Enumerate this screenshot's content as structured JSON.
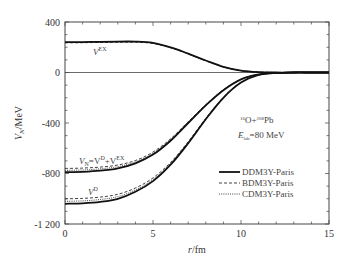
{
  "chart_data": {
    "type": "line",
    "title": "",
    "xlabel": "r/fm",
    "ylabel": "V_N/MeV",
    "xlim": [
      0,
      15
    ],
    "ylim": [
      -1200,
      400
    ],
    "x_ticks": [
      "0",
      "5",
      "10",
      "15"
    ],
    "y_ticks": [
      "400",
      "0",
      "-400",
      "-800",
      "-1 200"
    ],
    "grid": false,
    "legend_position": "lower right",
    "annotation": {
      "reaction": "16O+208Pb",
      "energy": "E_lab=80 MeV"
    },
    "curve_labels": [
      "V^EX",
      "V_N=V^D+V^EX",
      "V^D"
    ],
    "legend": [
      "DDM3Y-Paris",
      "BDM3Y-Paris",
      "CDM3Y-Paris"
    ],
    "x": [
      0,
      1,
      2,
      3,
      4,
      5,
      6,
      7,
      8,
      9,
      10,
      11,
      12,
      13,
      14,
      15
    ],
    "series": [
      {
        "name": "V^EX DDM3Y-Paris",
        "style": "solid",
        "values": [
          240,
          241,
          243,
          245,
          245,
          235,
          200,
          150,
          95,
          45,
          15,
          3,
          0,
          0,
          0,
          0
        ]
      },
      {
        "name": "V^EX BDM3Y-Paris",
        "style": "dashed",
        "values": [
          235,
          236,
          238,
          240,
          240,
          230,
          196,
          147,
          93,
          44,
          15,
          3,
          0,
          0,
          0,
          0
        ]
      },
      {
        "name": "V^EX CDM3Y-Paris",
        "style": "dotted",
        "values": [
          238,
          239,
          241,
          243,
          243,
          233,
          198,
          149,
          94,
          45,
          15,
          3,
          0,
          0,
          0,
          0
        ]
      },
      {
        "name": "V_N DDM3Y-Paris",
        "style": "solid",
        "values": [
          -790,
          -787,
          -778,
          -760,
          -720,
          -650,
          -540,
          -400,
          -260,
          -140,
          -55,
          -15,
          -3,
          0,
          0,
          0
        ]
      },
      {
        "name": "V_N BDM3Y-Paris",
        "style": "dashed",
        "values": [
          -760,
          -757,
          -749,
          -733,
          -697,
          -630,
          -525,
          -390,
          -255,
          -137,
          -54,
          -15,
          -3,
          0,
          0,
          0
        ]
      },
      {
        "name": "V_N CDM3Y-Paris",
        "style": "dotted",
        "values": [
          -775,
          -772,
          -763,
          -746,
          -708,
          -640,
          -532,
          -395,
          -257,
          -138,
          -54,
          -15,
          -3,
          0,
          0,
          0
        ]
      },
      {
        "name": "V^D DDM3Y-Paris",
        "style": "solid",
        "values": [
          -1040,
          -1036,
          -1025,
          -1000,
          -945,
          -860,
          -730,
          -560,
          -370,
          -200,
          -80,
          -20,
          -4,
          0,
          0,
          0
        ]
      },
      {
        "name": "V^D BDM3Y-Paris",
        "style": "dashed",
        "values": [
          -1000,
          -997,
          -987,
          -965,
          -915,
          -835,
          -712,
          -548,
          -363,
          -196,
          -78,
          -20,
          -4,
          0,
          0,
          0
        ]
      },
      {
        "name": "V^D CDM3Y-Paris",
        "style": "dotted",
        "values": [
          -1020,
          -1017,
          -1006,
          -983,
          -930,
          -848,
          -721,
          -554,
          -366,
          -198,
          -79,
          -20,
          -4,
          0,
          0,
          0
        ]
      }
    ]
  },
  "labels": {
    "ylabel_main": "V",
    "ylabel_sub": "N",
    "ylabel_unit": "/MeV",
    "xlabel_r": "r",
    "xlabel_unit": "/fm",
    "vex": "V",
    "vex_sup": "EX",
    "vn_main": "V",
    "vn_sub": "N",
    "vn_eq": "=V",
    "vn_sup_d": "D",
    "vn_plus": "+V",
    "vn_sup_ex": "EX",
    "vd": "V",
    "vd_sup": "D",
    "reaction_a_mass": "16",
    "reaction_a": "O+",
    "reaction_b_mass": "208",
    "reaction_b": "Pb",
    "energy_e": "E",
    "energy_sub": "lab",
    "energy_val": "=80 MeV",
    "legend_1": "DDM3Y-Paris",
    "legend_2": "BDM3Y-Paris",
    "legend_3": "CDM3Y-Paris",
    "xt0": "0",
    "xt1": "5",
    "xt2": "10",
    "xt3": "15",
    "yt0": "400",
    "yt1": "0",
    "yt2": "-400",
    "yt3": "-800",
    "yt4": "-1 200"
  }
}
